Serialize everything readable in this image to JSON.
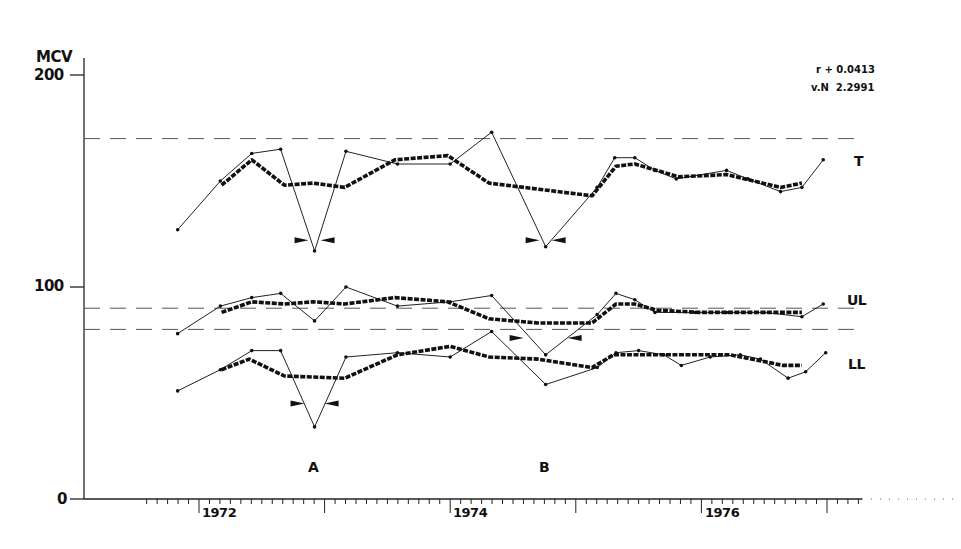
{
  "chart_data": {
    "type": "line",
    "title": "",
    "ylabel": "MCV",
    "xlabel": "",
    "ylim": [
      0,
      200
    ],
    "yticks": [
      0,
      100,
      200
    ],
    "xlim": [
      1970.9,
      1978.0
    ],
    "xticks": [
      1972,
      1974,
      1976
    ],
    "xtick_labels": [
      "1972",
      "1974",
      "1976"
    ],
    "x_minor_ticks": "monthly",
    "grid": false,
    "annotations": {
      "stats": [
        "r + 0.0413",
        "v.N  2.2991"
      ],
      "event_labels": [
        {
          "text": "A",
          "x": 1972.92
        },
        {
          "text": "B",
          "x": 1974.77
        }
      ]
    },
    "reference_lines": [
      {
        "name": "T limit",
        "y": 170
      },
      {
        "name": "UL limit",
        "y": 90
      },
      {
        "name": "LL limit",
        "y": 80
      }
    ],
    "series": [
      {
        "name": "T",
        "style": "thin-observed",
        "points": [
          [
            1971.83,
            127
          ],
          [
            1972.17,
            150
          ],
          [
            1972.42,
            163
          ],
          [
            1972.65,
            165
          ],
          [
            1972.92,
            117
          ],
          [
            1973.17,
            164
          ],
          [
            1973.58,
            158
          ],
          [
            1974.0,
            158
          ],
          [
            1974.33,
            173
          ],
          [
            1974.76,
            119
          ],
          [
            1975.17,
            147
          ],
          [
            1975.31,
            161
          ],
          [
            1975.47,
            161
          ],
          [
            1975.63,
            155
          ],
          [
            1975.8,
            151
          ],
          [
            1976.2,
            155
          ],
          [
            1976.37,
            151
          ],
          [
            1976.63,
            145
          ],
          [
            1976.8,
            147
          ],
          [
            1976.97,
            160
          ]
        ]
      },
      {
        "name": "T",
        "style": "thick-smoothed",
        "points": [
          [
            1972.18,
            148
          ],
          [
            1972.42,
            160
          ],
          [
            1972.68,
            148
          ],
          [
            1972.91,
            149
          ],
          [
            1973.16,
            147
          ],
          [
            1973.56,
            160
          ],
          [
            1773.98,
            162
          ],
          [
            1974.31,
            149
          ],
          [
            1975.13,
            143
          ],
          [
            1975.32,
            157
          ],
          [
            1975.47,
            158
          ],
          [
            1975.82,
            152
          ],
          [
            1976.2,
            153
          ],
          [
            1976.63,
            147
          ],
          [
            1976.8,
            149
          ]
        ]
      },
      {
        "name": "UL",
        "style": "thin-observed",
        "points": [
          [
            1971.83,
            78
          ],
          [
            1972.17,
            91
          ],
          [
            1972.42,
            95
          ],
          [
            1972.65,
            97
          ],
          [
            1972.92,
            84
          ],
          [
            1973.17,
            100
          ],
          [
            1973.58,
            91
          ],
          [
            1974.0,
            93
          ],
          [
            1974.33,
            96
          ],
          [
            1974.76,
            68
          ],
          [
            1975.17,
            87
          ],
          [
            1975.32,
            97
          ],
          [
            1975.47,
            94
          ],
          [
            1975.63,
            88
          ],
          [
            1975.95,
            88
          ],
          [
            1976.2,
            88
          ],
          [
            1976.5,
            88
          ],
          [
            1976.8,
            86
          ],
          [
            1976.97,
            92
          ]
        ]
      },
      {
        "name": "UL",
        "style": "thick-smoothed",
        "points": [
          [
            1972.18,
            88
          ],
          [
            1972.42,
            93
          ],
          [
            1972.68,
            92
          ],
          [
            1972.91,
            93
          ],
          [
            1973.16,
            92
          ],
          [
            1973.56,
            95
          ],
          [
            1973.98,
            93
          ],
          [
            1974.31,
            85
          ],
          [
            1974.7,
            83
          ],
          [
            1975.13,
            83
          ],
          [
            1975.32,
            92
          ],
          [
            1975.47,
            92
          ],
          [
            1975.65,
            89
          ],
          [
            1975.98,
            88
          ],
          [
            1976.5,
            88
          ],
          [
            1976.8,
            88
          ]
        ]
      },
      {
        "name": "LL",
        "style": "thin-observed",
        "points": [
          [
            1971.83,
            51
          ],
          [
            1972.17,
            61
          ],
          [
            1972.42,
            70
          ],
          [
            1972.65,
            70
          ],
          [
            1972.92,
            34
          ],
          [
            1973.17,
            67
          ],
          [
            1973.58,
            69
          ],
          [
            1974.0,
            67
          ],
          [
            1974.33,
            79
          ],
          [
            1974.76,
            54
          ],
          [
            1975.17,
            62
          ],
          [
            1975.32,
            69
          ],
          [
            1975.5,
            70
          ],
          [
            1975.7,
            68
          ],
          [
            1975.84,
            63
          ],
          [
            1976.07,
            67
          ],
          [
            1976.31,
            68
          ],
          [
            1976.47,
            66
          ],
          [
            1976.69,
            57
          ],
          [
            1976.83,
            60
          ],
          [
            1976.99,
            69
          ]
        ]
      },
      {
        "name": "LL",
        "style": "thick-smoothed",
        "points": [
          [
            1972.18,
            61
          ],
          [
            1972.4,
            66
          ],
          [
            1972.68,
            58
          ],
          [
            1973.16,
            57
          ],
          [
            1973.58,
            68
          ],
          [
            1974.0,
            72
          ],
          [
            1974.31,
            67
          ],
          [
            1974.7,
            66
          ],
          [
            1975.13,
            62
          ],
          [
            1975.3,
            68
          ],
          [
            1975.55,
            68
          ],
          [
            1975.84,
            68
          ],
          [
            1976.23,
            68
          ],
          [
            1976.65,
            63
          ],
          [
            1976.8,
            63
          ]
        ]
      }
    ],
    "series_labels": [
      {
        "text": "T",
        "y": 160
      },
      {
        "text": "UL",
        "y": 94
      },
      {
        "text": "LL",
        "y": 64
      }
    ],
    "intervention_markers": [
      {
        "event": "A",
        "series": "T",
        "x": 1972.92,
        "y": 122
      },
      {
        "event": "A",
        "series": "LL",
        "x": 1972.92,
        "y": 45
      },
      {
        "event": "B",
        "series": "T",
        "x": 1974.76,
        "y": 122
      },
      {
        "event": "B",
        "series": "UL",
        "x": 1974.76,
        "y": 76
      }
    ]
  },
  "labels": {
    "ylabel": "MCV",
    "y200": "200",
    "y100": "100",
    "y0": "0",
    "x1972": "1972",
    "x1974": "1974",
    "x1976": "1976",
    "stat1": "r + 0.0413",
    "stat2": "v.N  2.2991",
    "eventA": "A",
    "eventB": "B",
    "seriesT": "T",
    "seriesUL": "UL",
    "seriesLL": "LL"
  }
}
